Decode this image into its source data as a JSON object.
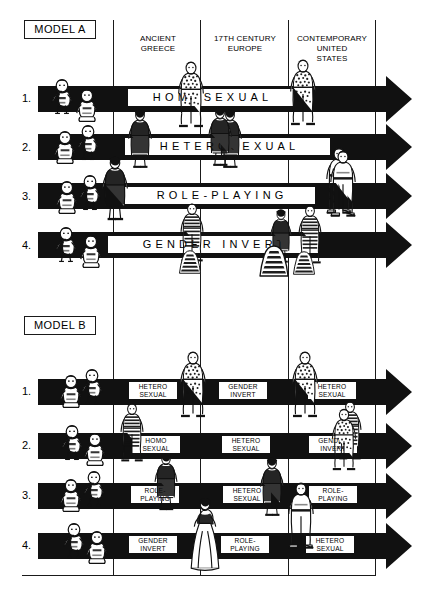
{
  "page": {
    "ink": "#111111",
    "paper": "#ffffff"
  },
  "columns": [
    {
      "id": "ancient-greece",
      "label": "ANCIENT\nGREECE"
    },
    {
      "id": "17th-century-europe",
      "label": "17TH CENTURY\nEUROPE"
    },
    {
      "id": "contemporary-us",
      "label": "CONTEMPORARY\nUNITED\nSTATES"
    }
  ],
  "column_labels": {
    "ancient_greece_line1": "ANCIENT",
    "ancient_greece_line2": "GREECE",
    "europe_line1": "17TH CENTURY",
    "europe_line2": "EUROPE",
    "us_line1": "CONTEMPORARY",
    "us_line2": "UNITED",
    "us_line3": "STATES"
  },
  "models": [
    {
      "id": "model-a",
      "label": "MODEL A",
      "rows": [
        {
          "number": "1.",
          "banner": "HOMOSEXUAL"
        },
        {
          "number": "2.",
          "banner": "HETEROSEXUAL"
        },
        {
          "number": "3.",
          "banner": "ROLE-PLAYING"
        },
        {
          "number": "4.",
          "banner": "GENDER INVERT"
        }
      ]
    },
    {
      "id": "model-b",
      "label": "MODEL B",
      "rows": [
        {
          "number": "1.",
          "tags": [
            {
              "line1": "HETERO",
              "line2": "SEXUAL"
            },
            {
              "line1": "GENDER",
              "line2": "INVERT"
            },
            {
              "line1": "HETERO",
              "line2": "SEXUAL"
            }
          ]
        },
        {
          "number": "2.",
          "tags": [
            {
              "line1": "HOMO",
              "line2": "SEXUAL"
            },
            {
              "line1": "HETERO",
              "line2": "SEXUAL"
            },
            {
              "line1": "GENDER",
              "line2": "INVERT"
            }
          ]
        },
        {
          "number": "3.",
          "tags": [
            {
              "line1": "ROLE-",
              "line2": "PLAYING"
            },
            {
              "line1": "HETERO",
              "line2": "SEXUAL"
            },
            {
              "line1": "ROLE-",
              "line2": "PLAYING"
            }
          ]
        },
        {
          "number": "4.",
          "tags": [
            {
              "line1": "GENDER",
              "line2": "INVERT"
            },
            {
              "line1": "ROLE-",
              "line2": "PLAYING"
            },
            {
              "line1": "HETERO",
              "line2": "SEXUAL"
            }
          ]
        }
      ]
    }
  ],
  "figures": {
    "infant": "infant-figure",
    "child": "child-figure",
    "adult_male": "adult-male-figure",
    "adult_female": "adult-female-figure"
  }
}
